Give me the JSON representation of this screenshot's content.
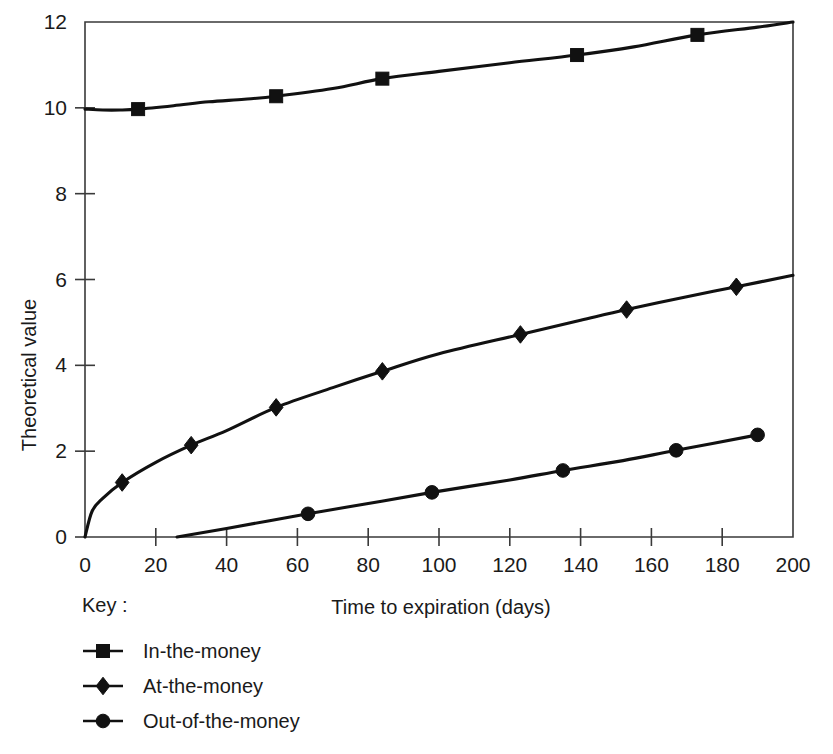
{
  "chart_data": {
    "type": "line",
    "title": "",
    "xlabel": "Time to expiration (days)",
    "ylabel": "Theoretical value",
    "xlim": [
      0,
      200
    ],
    "ylim": [
      0,
      12
    ],
    "xticks": [
      0,
      20,
      40,
      60,
      80,
      100,
      120,
      140,
      160,
      180,
      200
    ],
    "yticks": [
      0,
      2,
      4,
      6,
      8,
      10,
      12
    ],
    "xtick_labels": [
      "0",
      "20",
      "40",
      "60",
      "80",
      "100",
      "120",
      "140",
      "160",
      "180",
      "200"
    ],
    "ytick_labels": [
      "0",
      "2",
      "4",
      "6",
      "8",
      "10",
      "12"
    ],
    "grid": false,
    "legend_position": "below-left",
    "legend_title": "Key :",
    "series": [
      {
        "name": "In-the-money",
        "marker": "square",
        "color": "#111111",
        "points": [
          {
            "x": 0,
            "y": 9.97
          },
          {
            "x": 5,
            "y": 9.95
          },
          {
            "x": 10,
            "y": 9.95
          },
          {
            "x": 15,
            "y": 9.97
          },
          {
            "x": 25,
            "y": 10.05
          },
          {
            "x": 35,
            "y": 10.14
          },
          {
            "x": 45,
            "y": 10.2
          },
          {
            "x": 54,
            "y": 10.27
          },
          {
            "x": 70,
            "y": 10.45
          },
          {
            "x": 84,
            "y": 10.68
          },
          {
            "x": 100,
            "y": 10.85
          },
          {
            "x": 120,
            "y": 11.05
          },
          {
            "x": 139,
            "y": 11.23
          },
          {
            "x": 155,
            "y": 11.42
          },
          {
            "x": 173,
            "y": 11.7
          },
          {
            "x": 190,
            "y": 11.88
          },
          {
            "x": 200,
            "y": 12.0
          }
        ],
        "marker_points": [
          {
            "x": 15,
            "y": 9.97
          },
          {
            "x": 54,
            "y": 10.27
          },
          {
            "x": 84,
            "y": 10.68
          },
          {
            "x": 139,
            "y": 11.23
          },
          {
            "x": 173,
            "y": 11.7
          }
        ]
      },
      {
        "name": "At-the-money",
        "marker": "diamond",
        "color": "#111111",
        "points": [
          {
            "x": 0,
            "y": 0.0
          },
          {
            "x": 2,
            "y": 0.6
          },
          {
            "x": 5,
            "y": 0.9
          },
          {
            "x": 10.5,
            "y": 1.27
          },
          {
            "x": 20,
            "y": 1.74
          },
          {
            "x": 30,
            "y": 2.14
          },
          {
            "x": 40,
            "y": 2.48
          },
          {
            "x": 54,
            "y": 3.02
          },
          {
            "x": 70,
            "y": 3.48
          },
          {
            "x": 84,
            "y": 3.86
          },
          {
            "x": 100,
            "y": 4.27
          },
          {
            "x": 123,
            "y": 4.72
          },
          {
            "x": 140,
            "y": 5.05
          },
          {
            "x": 153,
            "y": 5.3
          },
          {
            "x": 170,
            "y": 5.6
          },
          {
            "x": 184,
            "y": 5.83
          },
          {
            "x": 200,
            "y": 6.1
          }
        ],
        "marker_points": [
          {
            "x": 10.5,
            "y": 1.27
          },
          {
            "x": 30,
            "y": 2.14
          },
          {
            "x": 54,
            "y": 3.02
          },
          {
            "x": 84,
            "y": 3.86
          },
          {
            "x": 123,
            "y": 4.72
          },
          {
            "x": 153,
            "y": 5.3
          },
          {
            "x": 184,
            "y": 5.83
          }
        ]
      },
      {
        "name": "Out-of-the-money",
        "marker": "circle",
        "color": "#111111",
        "points": [
          {
            "x": 26,
            "y": 0.0
          },
          {
            "x": 40,
            "y": 0.2
          },
          {
            "x": 63,
            "y": 0.54
          },
          {
            "x": 80,
            "y": 0.78
          },
          {
            "x": 98,
            "y": 1.04
          },
          {
            "x": 120,
            "y": 1.33
          },
          {
            "x": 135,
            "y": 1.55
          },
          {
            "x": 152,
            "y": 1.78
          },
          {
            "x": 167,
            "y": 2.02
          },
          {
            "x": 190,
            "y": 2.38
          }
        ],
        "marker_points": [
          {
            "x": 63,
            "y": 0.54
          },
          {
            "x": 98,
            "y": 1.04
          },
          {
            "x": 135,
            "y": 1.55
          },
          {
            "x": 167,
            "y": 2.02
          },
          {
            "x": 190,
            "y": 2.38
          }
        ]
      }
    ]
  },
  "legend": {
    "title": "Key :",
    "entries": [
      {
        "label": "In-the-money",
        "marker": "square"
      },
      {
        "label": "At-the-money",
        "marker": "diamond"
      },
      {
        "label": "Out-of-the-money",
        "marker": "circle"
      }
    ]
  },
  "axes": {
    "x_title": "Time to expiration (days)",
    "y_title": "Theoretical value"
  }
}
